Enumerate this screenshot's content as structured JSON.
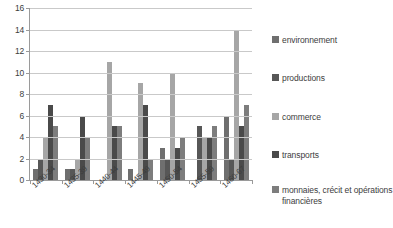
{
  "chart_data": {
    "type": "bar",
    "title": "",
    "subtitle": "",
    "xlabel": "",
    "ylabel": "",
    "ylim": [
      0,
      16
    ],
    "ytick_step": 2,
    "yticks": [
      16,
      14,
      12,
      10,
      8,
      6,
      4,
      2,
      0
    ],
    "grid": true,
    "legend_position": "right",
    "categories": [
      "1430-34",
      "1435-39",
      "1440-44",
      "1445-49",
      "1450-54",
      "1455-59",
      "1460-67"
    ],
    "series": [
      {
        "name": "environnement",
        "color": "#6f6f6f",
        "values": [
          1,
          1,
          0,
          1,
          3,
          0,
          6
        ]
      },
      {
        "name": "productions",
        "color": "#575757",
        "values": [
          2,
          1,
          0,
          0,
          2,
          5,
          2
        ]
      },
      {
        "name": "commerce",
        "color": "#a6a6a6",
        "values": [
          4,
          2,
          11,
          9,
          10,
          4,
          14
        ]
      },
      {
        "name": "transports",
        "color": "#4a4a4a",
        "values": [
          7,
          6,
          5,
          7,
          3,
          4,
          5
        ]
      },
      {
        "name": "monnaies, crécit et opérations financières",
        "color": "#7d7d7d",
        "values": [
          5,
          4,
          5,
          2,
          4,
          5,
          7
        ]
      }
    ]
  },
  "legend": {
    "entries": [
      {
        "label": "environnement"
      },
      {
        "label": "productions"
      },
      {
        "label": "commerce"
      },
      {
        "label": "transports"
      },
      {
        "label": "monnaies, crécit et opérations financières"
      }
    ]
  },
  "axis": {
    "y_tick_labels": [
      "16",
      "14",
      "12",
      "10",
      "8",
      "6",
      "4",
      "2",
      "0"
    ],
    "x_tick_labels": [
      "1430-34",
      "1435-39",
      "1440-44",
      "1445-49",
      "1450-54",
      "1455-59",
      "1460-67"
    ]
  },
  "colors": {
    "gridline": "#c9c9c9",
    "axis": "#9a9a9a",
    "text": "#3d3d3d",
    "background": "#ffffff"
  }
}
